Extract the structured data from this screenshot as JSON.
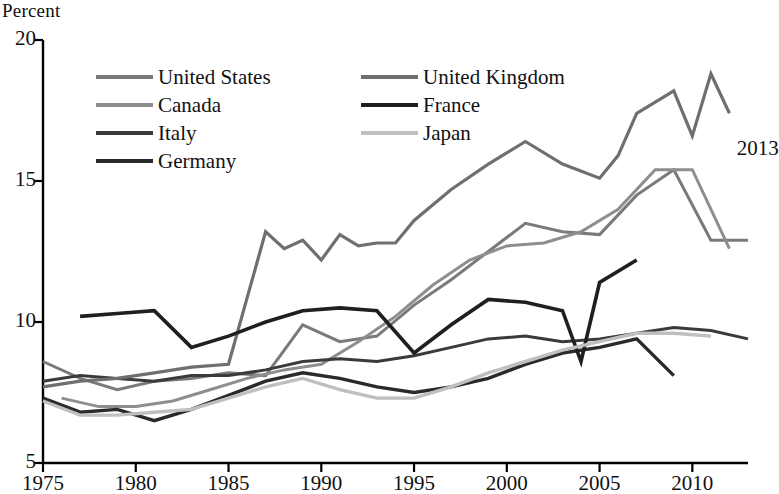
{
  "chart_data": {
    "type": "line",
    "title": "",
    "subtitle": "",
    "xlabel": "",
    "ylabel": "Percent",
    "ylabel_position": "top-left",
    "xlim": [
      1975,
      2013
    ],
    "ylim": [
      5,
      20
    ],
    "yticks": [
      "5",
      "10",
      "15",
      "20"
    ],
    "ytick_values": [
      5,
      10,
      15,
      20
    ],
    "xticks": [
      "1975",
      "1980",
      "1985",
      "1990",
      "1995",
      "2000",
      "2005",
      "2010"
    ],
    "xtick_values": [
      1975,
      1980,
      1985,
      1990,
      1995,
      2000,
      2005,
      2010
    ],
    "grid": false,
    "legend_position": "upper-left-inside",
    "annotations": [
      {
        "text": "2013",
        "x": 2012.4,
        "y": 16.1
      }
    ],
    "series": [
      {
        "name": "United States",
        "color": "#7a7a7a",
        "width": 3.0,
        "x": [
          1975,
          1976,
          1977,
          1978,
          1979,
          1980,
          1981,
          1982,
          1983,
          1984,
          1985,
          1986,
          1987,
          1988,
          1989,
          1990,
          1991,
          1992,
          1993,
          1994,
          1995,
          1996,
          1997,
          1998,
          1999,
          2000,
          2001,
          2002,
          2003,
          2004,
          2005,
          2006,
          2007,
          2008,
          2009,
          2010,
          2011,
          2012,
          2013
        ],
        "y": [
          8.5,
          7.7,
          7.1,
          6.1,
          5.8,
          7.1,
          7.6,
          9.7,
          9.6,
          7.5,
          7.2,
          7.0,
          6.2,
          5.5,
          5.3,
          5.6,
          6.8,
          7.5,
          6.9,
          6.1,
          5.6,
          5.4,
          4.9,
          4.5,
          4.2,
          4.0,
          4.7,
          5.8,
          6.0,
          5.5,
          5.1,
          4.6,
          4.6,
          5.8,
          9.3,
          9.6,
          8.9,
          8.1,
          7.4
        ],
        "plotted_x": [
          1975,
          1977,
          1979,
          1981,
          1983,
          1985,
          1987,
          1989,
          1991,
          1993,
          1995,
          1997,
          1999,
          2001,
          2003,
          2005,
          2007,
          2009,
          2011,
          2013
        ],
        "plotted_y": [
          8.6,
          8.0,
          7.6,
          7.9,
          8.0,
          8.2,
          8.1,
          9.9,
          9.3,
          9.5,
          10.6,
          11.5,
          12.5,
          13.5,
          13.2,
          13.1,
          14.5,
          15.4,
          12.9,
          12.9
        ]
      },
      {
        "name": "Canada",
        "color": "#8e8e8e",
        "width": 3.0,
        "plotted_x": [
          1976,
          1978,
          1980,
          1982,
          1984,
          1986,
          1988,
          1990,
          1992,
          1994,
          1996,
          1998,
          2000,
          2002,
          2004,
          2006,
          2008,
          2010,
          2012
        ],
        "plotted_y": [
          7.3,
          7.0,
          7.0,
          7.2,
          7.6,
          8.0,
          8.3,
          8.5,
          9.3,
          10.2,
          11.3,
          12.2,
          12.7,
          12.8,
          13.2,
          14.0,
          15.4,
          15.4,
          12.6
        ]
      },
      {
        "name": "Italy",
        "color": "#3a3a3a",
        "width": 3.0,
        "plotted_x": [
          1975,
          1977,
          1979,
          1981,
          1983,
          1985,
          1987,
          1989,
          1991,
          1993,
          1995,
          1997,
          1999,
          2001,
          2003,
          2005,
          2007,
          2009,
          2011,
          2013
        ],
        "plotted_y": [
          7.9,
          8.1,
          8.0,
          7.9,
          8.1,
          8.1,
          8.3,
          8.6,
          8.7,
          8.6,
          8.8,
          9.1,
          9.4,
          9.5,
          9.3,
          9.4,
          9.6,
          9.8,
          9.7,
          9.4
        ]
      },
      {
        "name": "Germany",
        "color": "#2a2a2a",
        "width": 3.4,
        "plotted_x": [
          1975,
          1977,
          1979,
          1981,
          1983,
          1985,
          1987,
          1989,
          1991,
          1993,
          1995,
          1997,
          1999,
          2001,
          2003,
          2005,
          2007,
          2009
        ],
        "plotted_y": [
          7.3,
          6.8,
          6.9,
          6.5,
          6.9,
          7.4,
          7.9,
          8.2,
          8.0,
          7.7,
          7.5,
          7.7,
          8.0,
          8.5,
          8.9,
          9.1,
          9.4,
          8.1
        ]
      },
      {
        "name": "United Kingdom",
        "color": "#6f6f6f",
        "width": 3.2,
        "plotted_x": [
          1975,
          1977,
          1979,
          1981,
          1983,
          1985,
          1987,
          1988,
          1989,
          1990,
          1991,
          1992,
          1993,
          1994,
          1995,
          1997,
          1999,
          2001,
          2003,
          2005,
          2006,
          2007,
          2009,
          2010,
          2011,
          2012
        ],
        "plotted_y": [
          7.7,
          7.9,
          8.0,
          8.2,
          8.4,
          8.5,
          13.2,
          12.6,
          12.9,
          12.2,
          13.1,
          12.7,
          12.8,
          12.8,
          13.6,
          14.7,
          15.6,
          16.4,
          15.6,
          15.1,
          15.9,
          17.4,
          18.2,
          16.6,
          18.8,
          17.4
        ]
      },
      {
        "name": "France",
        "color": "#1f1f1f",
        "width": 3.6,
        "plotted_x": [
          1977,
          1979,
          1981,
          1983,
          1985,
          1987,
          1989,
          1991,
          1993,
          1995,
          1997,
          1999,
          2001,
          2003,
          2004,
          2005,
          2007
        ],
        "plotted_y": [
          10.2,
          10.3,
          10.4,
          9.1,
          9.5,
          10.0,
          10.4,
          10.5,
          10.4,
          8.9,
          9.9,
          10.8,
          10.7,
          10.4,
          8.6,
          11.4,
          12.2
        ]
      },
      {
        "name": "Japan",
        "color": "#bfbfbf",
        "width": 3.4,
        "plotted_x": [
          1975,
          1977,
          1979,
          1981,
          1983,
          1985,
          1987,
          1989,
          1991,
          1993,
          1995,
          1997,
          1999,
          2001,
          2003,
          2005,
          2007,
          2009,
          2011
        ],
        "plotted_y": [
          7.2,
          6.7,
          6.7,
          6.8,
          6.9,
          7.3,
          7.7,
          8.0,
          7.6,
          7.3,
          7.3,
          7.7,
          8.2,
          8.6,
          9.0,
          9.3,
          9.6,
          9.6,
          9.5
        ]
      }
    ],
    "legend": [
      {
        "label": "United States",
        "color": "#7a7a7a"
      },
      {
        "label": "Canada",
        "color": "#8e8e8e"
      },
      {
        "label": "Italy",
        "color": "#3a3a3a"
      },
      {
        "label": "Germany",
        "color": "#2a2a2a"
      },
      {
        "label": "United Kingdom",
        "color": "#6f6f6f"
      },
      {
        "label": "France",
        "color": "#1f1f1f"
      },
      {
        "label": "Japan",
        "color": "#bfbfbf"
      }
    ],
    "legend_columns": [
      [
        0,
        1,
        2,
        3
      ],
      [
        4,
        5,
        6
      ]
    ]
  },
  "axis_label": {
    "y_top": "Percent"
  },
  "end_annotation": {
    "text": "2013"
  }
}
